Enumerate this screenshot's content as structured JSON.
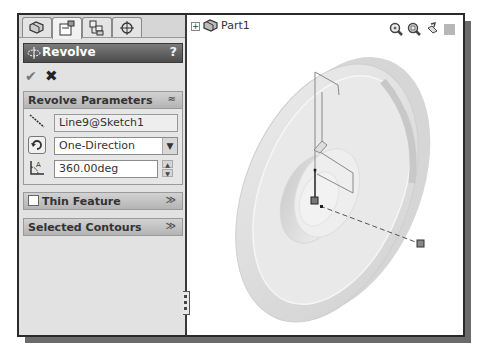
{
  "tabs": [
    {
      "name": "feature-manager",
      "icon": "feature-tree-icon"
    },
    {
      "name": "property-manager",
      "icon": "property-manager-icon",
      "active": true
    },
    {
      "name": "configuration-manager",
      "icon": "configuration-icon"
    },
    {
      "name": "dimxpert-manager",
      "icon": "crosshair-icon"
    }
  ],
  "property_manager": {
    "title": "Revolve",
    "help": "?",
    "ok_icon": "✔",
    "cancel_icon": "✖"
  },
  "revolve_parameters": {
    "header": "Revolve Parameters",
    "collapse_glyph": "≈",
    "axis_value": "Line9@Sketch1",
    "direction_value": "One-Direction",
    "angle_value": "360.00deg"
  },
  "thin_feature": {
    "header": "Thin Feature",
    "checked": false,
    "expand_glyph": "≫"
  },
  "selected_contours": {
    "header": "Selected Contours",
    "expand_glyph": "≫"
  },
  "graphics": {
    "tree_root": "Part1",
    "tree_expand": "+",
    "view_tools": [
      "zoom-to-fit-icon",
      "zoom-to-area-icon",
      "previous-view-icon",
      "display-style-icon"
    ]
  },
  "colors": {
    "panel_bg": "#e2e2e2",
    "header_dark": "#4c4c4c",
    "model_face": "#e4e4e4",
    "model_shadow": "#c0c0c0"
  }
}
